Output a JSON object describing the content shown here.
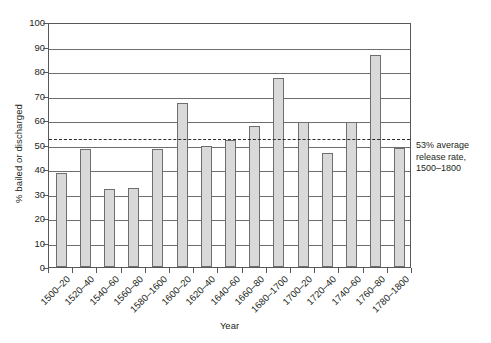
{
  "chart_data": {
    "type": "bar",
    "title": "",
    "xlabel": "Year",
    "ylabel": "% bailed or discharged",
    "ylim": [
      0,
      100
    ],
    "ytick_step": 10,
    "yticks": [
      0,
      10,
      20,
      30,
      40,
      50,
      60,
      70,
      80,
      90,
      100
    ],
    "grid": "horizontal",
    "legend": "none",
    "categories": [
      "1500–20",
      "1520–40",
      "1540–60",
      "1560–80",
      "1580–1600",
      "1600–20",
      "1620–40",
      "1640–60",
      "1660–80",
      "1680–1700",
      "1700–20",
      "1720–40",
      "1740–60",
      "1760–80",
      "1780–1800"
    ],
    "values": [
      38.5,
      48.0,
      32.0,
      32.3,
      48.0,
      67.0,
      49.3,
      52.0,
      57.5,
      77.3,
      59.0,
      46.5,
      59.3,
      86.5,
      48.5
    ],
    "bar_fill": "#d9d9d9",
    "bar_edge": "#6d6e70",
    "reference_line": {
      "value": 53,
      "style": "dashed",
      "color": "#2b2b2b",
      "label_lines": [
        "53% average",
        "release rate,",
        "1500–1800"
      ]
    }
  },
  "annotation": {
    "line1": "53% average",
    "line2": "release rate,",
    "line3": "1500–1800"
  },
  "axes": {
    "x_title": "Year",
    "y_title": "% bailed or discharged"
  }
}
